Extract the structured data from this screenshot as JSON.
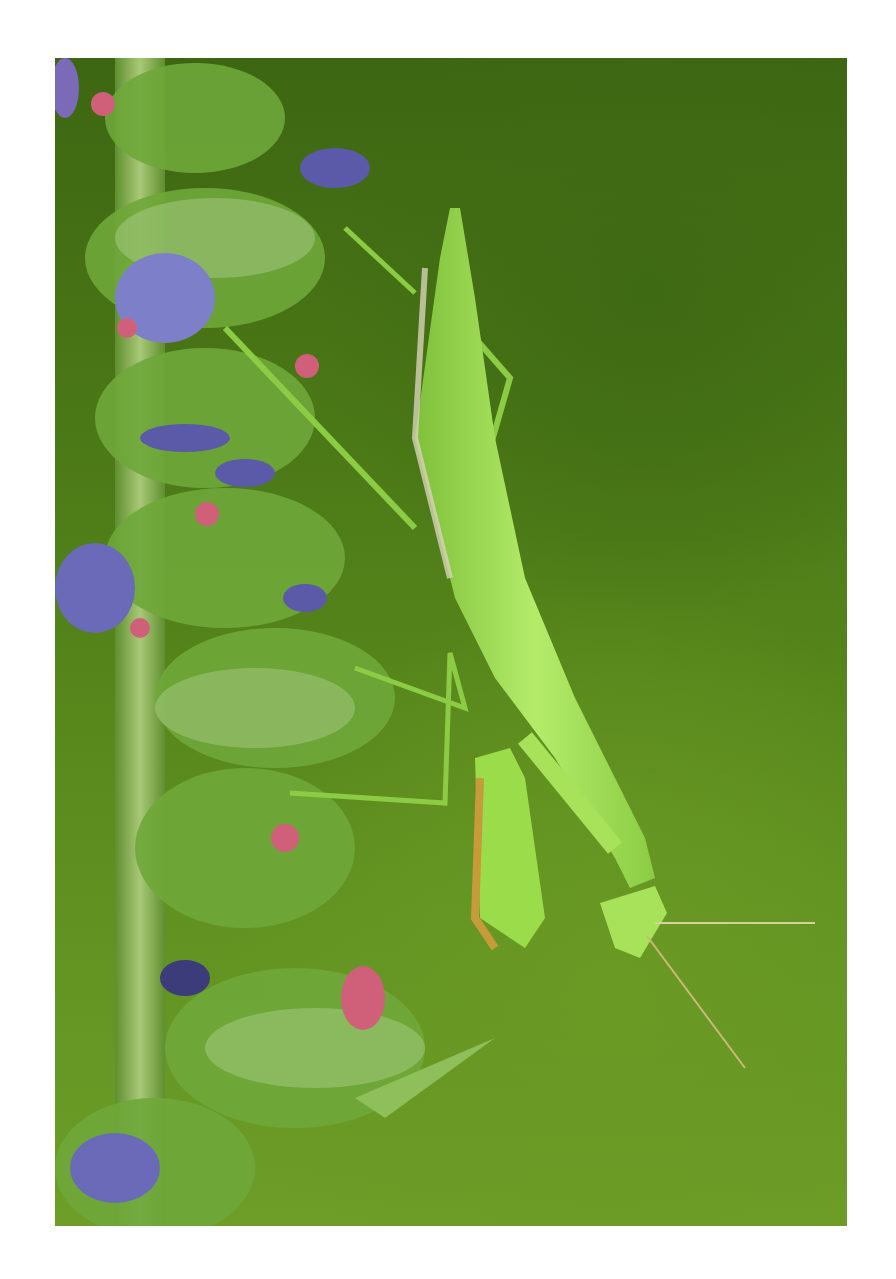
{
  "image": {
    "description": "Green praying mantis hanging from a hairy flowering stem with blue-purple blossoms and pink buds, against a blurred green background",
    "subject": "praying mantis",
    "colors": {
      "background_dark": "#3d6612",
      "background_light": "#6e9e28",
      "mantis": "#9bdc4a",
      "mantis_highlight": "#c8f08a",
      "flower_blue": "#5a5aa8",
      "bud_pink": "#d0607a",
      "stem": "#7ea84a",
      "frame": "#ffffff"
    }
  }
}
